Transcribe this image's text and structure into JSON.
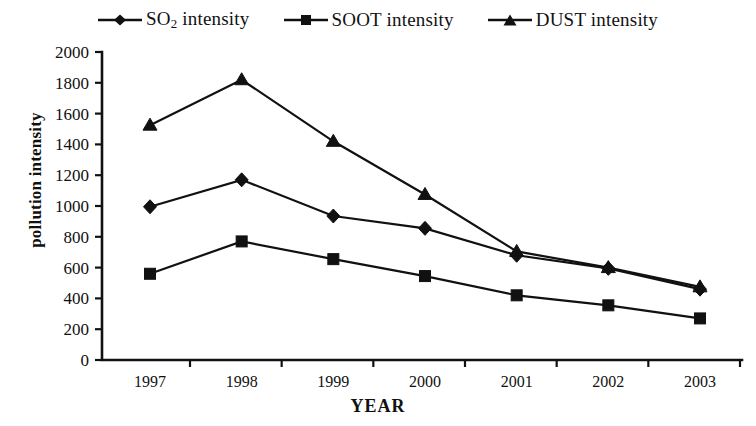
{
  "chart_data": {
    "type": "line",
    "title": "",
    "xlabel": "YEAR",
    "ylabel": "pollution intensity",
    "categories": [
      "1997",
      "1998",
      "1999",
      "2000",
      "2001",
      "2002",
      "2003"
    ],
    "x": [
      1997,
      1998,
      1999,
      2000,
      2001,
      2002,
      2003
    ],
    "ylim": [
      0,
      2000
    ],
    "ytick_step": 200,
    "yticks": [
      "0",
      "200",
      "400",
      "600",
      "800",
      "1000",
      "1200",
      "1400",
      "1600",
      "1800",
      "2000"
    ],
    "grid": false,
    "legend_position": "top-center",
    "series": [
      {
        "name": "SO2 intensity",
        "label_html": "SO<sub>2</sub> intensity",
        "marker": "diamond",
        "color": "#111111",
        "values": [
          995,
          1170,
          935,
          855,
          680,
          595,
          460
        ]
      },
      {
        "name": "SOOT intensity",
        "label_html": "SOOT intensity",
        "marker": "square",
        "color": "#111111",
        "values": [
          560,
          770,
          655,
          545,
          420,
          355,
          270
        ]
      },
      {
        "name": "DUST intensity",
        "label_html": "DUST intensity",
        "marker": "triangle",
        "color": "#111111",
        "values": [
          1525,
          1820,
          1420,
          1075,
          705,
          600,
          475
        ]
      }
    ]
  },
  "legend": {
    "items": [
      {
        "label": "SO2 intensity",
        "marker": "diamond"
      },
      {
        "label": "SOOT intensity",
        "marker": "square"
      },
      {
        "label": "DUST intensity",
        "marker": "triangle"
      }
    ]
  },
  "axes": {
    "y_title": "pollution intensity",
    "x_title": "YEAR"
  }
}
